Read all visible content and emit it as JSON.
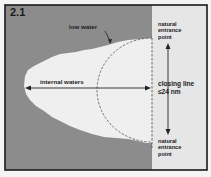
{
  "figure": {
    "number": "2.1",
    "colors": {
      "land": "#8c8c8c",
      "internal_water": "#efefef",
      "sea": "#e6e6e6",
      "frame": "#1a1a1a",
      "lines": "#333333"
    }
  },
  "labels": {
    "low_water": "low water",
    "internal_waters": "internal waters",
    "closing_line": "closing line",
    "closing_limit": "≤24 nm",
    "entrance_top": [
      "natural",
      "entrance",
      "point"
    ],
    "entrance_bottom": [
      "natural",
      "entrance",
      "point"
    ]
  }
}
